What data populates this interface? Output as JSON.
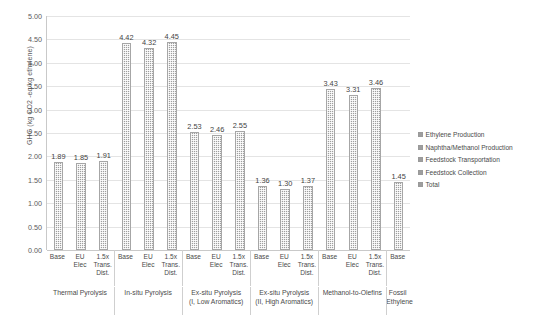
{
  "chart_data": {
    "type": "bar",
    "title": "",
    "xlabel": "",
    "ylabel": "GHG (kg CO2 -eq/kg ethylene)",
    "ylim": [
      0.0,
      5.0
    ],
    "ytick_labels": [
      "0.00",
      "0.50",
      "1.00",
      "1.50",
      "2.00",
      "2.50",
      "3.00",
      "3.50",
      "4.00",
      "4.50",
      "5.00"
    ],
    "ytick_values": [
      0.0,
      0.5,
      1.0,
      1.5,
      2.0,
      2.5,
      3.0,
      3.5,
      4.0,
      4.5,
      5.0
    ],
    "grid": true,
    "legend_position": "right",
    "categories": [
      "Base",
      "EU Elec",
      "1.5x Trans. Dist.",
      "Base",
      "EU Elec",
      "1.5x Trans. Dist.",
      "Base",
      "EU Elec",
      "1.5x Trans. Dist.",
      "Base",
      "EU Elec",
      "1.5x Trans. Dist.",
      "Base",
      "EU Elec",
      "1.5x Trans. Dist.",
      "Base"
    ],
    "values": [
      1.89,
      1.85,
      1.91,
      4.42,
      4.32,
      4.45,
      2.53,
      2.46,
      2.55,
      1.36,
      1.3,
      1.37,
      3.43,
      3.31,
      3.46,
      1.45
    ],
    "data_labels": [
      "1.89",
      "1.85",
      "1.91",
      "4.42",
      "4.32",
      "4.45",
      "2.53",
      "2.46",
      "2.55",
      "1.36",
      "1.30",
      "1.37",
      "3.43",
      "3.31",
      "3.46",
      "1.45"
    ],
    "groups": [
      {
        "label": "Thermal Pyrolysis",
        "count": 3
      },
      {
        "label": "In-situ Pyrolysis",
        "count": 3
      },
      {
        "label": "Ex-situ Pyrolysis (I, Low Aromatics)",
        "count": 3
      },
      {
        "label": "Ex-situ Pyrolysis (II, High Aromatics)",
        "count": 3
      },
      {
        "label": "Methanol-to-Olefins",
        "count": 3
      },
      {
        "label": "Fossil Ethylene",
        "count": 1
      }
    ],
    "series": [
      {
        "name": "Ethylene Production"
      },
      {
        "name": "Naphtha/Methanol Production"
      },
      {
        "name": "Feedstock Transportation"
      },
      {
        "name": "Feedstock Collection"
      },
      {
        "name": "Total"
      }
    ],
    "legend_entries": [
      "Ethylene Production",
      "Naphtha/Methanol Production",
      "Feedstock Transportation",
      "Feedstock Collection",
      "Total"
    ],
    "bar_color": "#9e9e9e",
    "grid_color": "#e4e4e4",
    "axis_color": "#c9c9c9"
  },
  "axis": {
    "y_title": "GHG (kg CO2 -eq/kg ethylene)"
  },
  "cat_labels": [
    {
      "l1": "Base",
      "l2": "",
      "l3": ""
    },
    {
      "l1": "EU Elec",
      "l2": "",
      "l3": ""
    },
    {
      "l1": "1.5x",
      "l2": "Trans.",
      "l3": "Dist."
    },
    {
      "l1": "Base",
      "l2": "",
      "l3": ""
    },
    {
      "l1": "EU Elec",
      "l2": "",
      "l3": ""
    },
    {
      "l1": "1.5x",
      "l2": "Trans.",
      "l3": "Dist."
    },
    {
      "l1": "Base",
      "l2": "",
      "l3": ""
    },
    {
      "l1": "EU Elec",
      "l2": "",
      "l3": ""
    },
    {
      "l1": "1.5x",
      "l2": "Trans.",
      "l3": "Dist."
    },
    {
      "l1": "Base",
      "l2": "",
      "l3": ""
    },
    {
      "l1": "EU Elec",
      "l2": "",
      "l3": ""
    },
    {
      "l1": "1.5x",
      "l2": "Trans.",
      "l3": "Dist."
    },
    {
      "l1": "Base",
      "l2": "",
      "l3": ""
    },
    {
      "l1": "EU Elec",
      "l2": "",
      "l3": ""
    },
    {
      "l1": "1.5x",
      "l2": "Trans.",
      "l3": "Dist."
    },
    {
      "l1": "Base",
      "l2": "",
      "l3": ""
    }
  ],
  "group_labels": [
    {
      "line1": "Thermal Pyrolysis",
      "line2": ""
    },
    {
      "line1": "In-situ Pyrolysis",
      "line2": ""
    },
    {
      "line1": "Ex-situ Pyrolysis",
      "line2": "(I, Low Aromatics)"
    },
    {
      "line1": "Ex-situ Pyrolysis",
      "line2": "(II, High Aromatics)"
    },
    {
      "line1": "Methanol-to-Olefins",
      "line2": ""
    },
    {
      "line1": "Fossil",
      "line2": "Ethylene"
    }
  ]
}
